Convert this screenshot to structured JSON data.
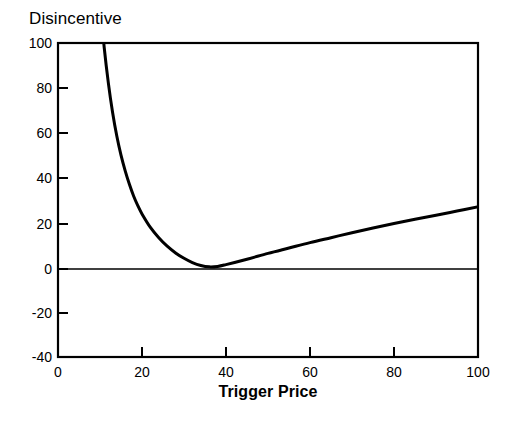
{
  "chart_data": {
    "type": "line",
    "title": "Disincentive",
    "subtitle": "",
    "xlabel": "Trigger Price",
    "ylabel": "",
    "ylabel_is_title": true,
    "xlim": [
      0,
      100
    ],
    "ylim": [
      -40,
      100
    ],
    "xticks": [
      0,
      20,
      40,
      60,
      80,
      100
    ],
    "xtick_labels": [
      "0",
      "20",
      "40",
      "60",
      "80",
      "100"
    ],
    "yticks": [
      -40,
      -20,
      0,
      20,
      40,
      60,
      80,
      100
    ],
    "ytick_labels": [
      "-40",
      "-20",
      "0",
      "20",
      "40",
      "60",
      "80",
      "100"
    ],
    "grid": false,
    "legend": false,
    "legend_position": "none",
    "frame": "box",
    "tick_direction": "in",
    "zero_line": 0,
    "line_color": "#000000",
    "line_width": 3,
    "axis_color": "#000000",
    "background": "#ffffff",
    "annotations": [],
    "series": [
      {
        "name": "Disincentive",
        "x": [
          10,
          11,
          12,
          13,
          14,
          15,
          16,
          17,
          18,
          19,
          20,
          22,
          24,
          26,
          28,
          30,
          32,
          34,
          36,
          38,
          40,
          45,
          50,
          55,
          60,
          65,
          70,
          75,
          80,
          85,
          90,
          95,
          100
        ],
        "y": [
          118.0,
          98.0,
          82.0,
          69.0,
          58.5,
          50.0,
          43.0,
          37.0,
          31.8,
          27.5,
          23.8,
          17.8,
          13.2,
          9.4,
          6.4,
          4.0,
          2.1,
          0.8,
          0.2,
          0.4,
          1.2,
          3.6,
          6.2,
          8.6,
          11.0,
          13.2,
          15.4,
          17.5,
          19.5,
          21.4,
          23.2,
          25.1,
          27.0
        ]
      }
    ],
    "notes": {
      "minimum_x": 35,
      "minimum_y": 0,
      "value_at_x100": 27,
      "curve_enters_top_at_x": 10
    }
  },
  "figure": {
    "title": "Disincentive",
    "xlabel": "Trigger Price"
  }
}
